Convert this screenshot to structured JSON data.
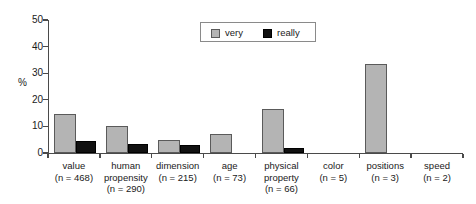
{
  "chart_data": {
    "type": "bar",
    "title": "",
    "xlabel": "",
    "ylabel": "%",
    "ylim": [
      0,
      50
    ],
    "yticks": [
      "0",
      "10",
      "20",
      "30",
      "40",
      "50"
    ],
    "grid": false,
    "legend_position": "top-right",
    "categories": [
      "value",
      "human propensity",
      "dimension",
      "age",
      "physical property",
      "color",
      "positions",
      "speed"
    ],
    "category_labels": [
      {
        "name": "value",
        "n": "(n = 468)",
        "lines": [
          "value"
        ]
      },
      {
        "name": "human propensity",
        "n": "(n = 290)",
        "lines": [
          "human",
          "propensity"
        ]
      },
      {
        "name": "dimension",
        "n": "(n = 215)",
        "lines": [
          "dimension"
        ]
      },
      {
        "name": "age",
        "n": "(n = 73)",
        "lines": [
          "age"
        ]
      },
      {
        "name": "physical property",
        "n": "(n = 66)",
        "lines": [
          "physical",
          "property"
        ]
      },
      {
        "name": "color",
        "n": "(n = 5)",
        "lines": [
          "color"
        ]
      },
      {
        "name": "positions",
        "n": "(n = 3)",
        "lines": [
          "positions"
        ]
      },
      {
        "name": "speed",
        "n": "(n = 2)",
        "lines": [
          "speed"
        ]
      }
    ],
    "series": [
      {
        "name": "very",
        "color": "#b4b4b4",
        "values": [
          14.5,
          10.0,
          5.0,
          7.0,
          16.5,
          0,
          33.5,
          0
        ]
      },
      {
        "name": "really",
        "color": "#111111",
        "values": [
          4.5,
          3.5,
          3.0,
          0,
          2.0,
          0,
          0,
          0
        ]
      }
    ]
  },
  "legend": {
    "items": [
      {
        "label": "very",
        "swatch": "very"
      },
      {
        "label": "really",
        "swatch": "really"
      }
    ]
  },
  "axis": {
    "y_label": "%",
    "y_ticks": [
      "0",
      "10",
      "20",
      "30",
      "40",
      "50"
    ]
  }
}
